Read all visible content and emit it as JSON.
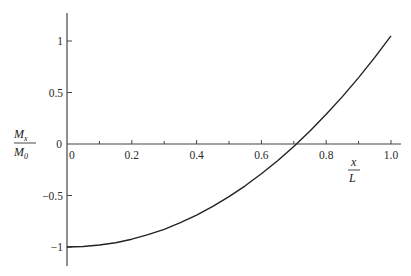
{
  "chart_data": {
    "type": "line",
    "title": "",
    "xlabel": "x/L",
    "ylabel": "M_x/M_0",
    "xlabel_parts": {
      "num": "x",
      "den": "L"
    },
    "ylabel_parts": {
      "num": "M",
      "num_sub": "x",
      "den": "M",
      "den_sub": "0"
    },
    "xlim": [
      0,
      1.0
    ],
    "ylim": [
      -1.2,
      1.3
    ],
    "grid": false,
    "legend": null,
    "x_ticks": [
      0,
      0.2,
      0.4,
      0.6,
      0.8,
      1.0
    ],
    "x_tick_labels": [
      "0",
      "0.2",
      "0.4",
      "0.6",
      "0.8",
      "1.0"
    ],
    "x_minor_ticks": [
      0.1,
      0.3,
      0.5,
      0.7,
      0.9
    ],
    "y_ticks": [
      1,
      0.5,
      0,
      -0.5,
      -1
    ],
    "y_tick_labels": [
      "1",
      "0.5",
      "0",
      "−0.5",
      "−1"
    ],
    "series": [
      {
        "name": "M_x/M_0",
        "color": "#222222",
        "x": [
          0,
          0.05,
          0.1,
          0.15,
          0.2,
          0.25,
          0.3,
          0.35,
          0.4,
          0.45,
          0.5,
          0.55,
          0.6,
          0.65,
          0.7,
          0.75,
          0.8,
          0.85,
          0.9,
          0.95,
          1.0
        ],
        "y": [
          -1.0,
          -0.995,
          -0.981,
          -0.958,
          -0.924,
          -0.881,
          -0.828,
          -0.764,
          -0.69,
          -0.606,
          -0.511,
          -0.406,
          -0.289,
          -0.162,
          -0.023,
          0.126,
          0.288,
          0.46,
          0.645,
          0.841,
          1.05
        ]
      }
    ],
    "annotations": []
  },
  "layout": {
    "x0_px": 67,
    "x1_px": 391,
    "y0_px": 144,
    "y_unit_px": 103,
    "axis_color": "#444444"
  }
}
